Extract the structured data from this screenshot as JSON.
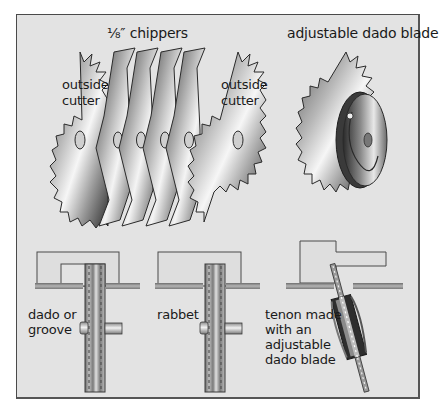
{
  "figure": {
    "top_labels": {
      "chippers": "⅛″ chippers",
      "adjustable": "adjustable dado blade"
    },
    "blade_labels": {
      "outside_cutter_left": [
        "outside",
        "cutter"
      ],
      "outside_cutter_right": [
        "outside",
        "cutter"
      ]
    },
    "bottom_labels": {
      "dado": [
        "dado or",
        "groove"
      ],
      "rabbet": [
        "rabbet"
      ],
      "tenon": [
        "tenon made",
        "with an",
        "adjustable",
        "dado blade"
      ]
    },
    "colors": {
      "background": "#e3e3e3",
      "frame_border": "#4a4a4a",
      "steel_light": "#f4f4f4",
      "steel_dark": "#3a3a3a",
      "text": "#1a1a1a"
    }
  }
}
